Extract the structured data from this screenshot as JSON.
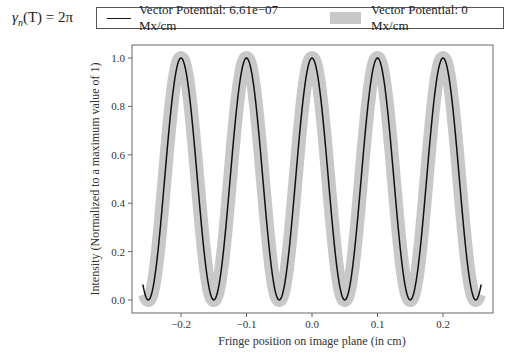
{
  "formula": {
    "symbol": "γ",
    "subscript": "n",
    "arg": "(T)",
    "rhs": "= 2π"
  },
  "legend": {
    "items": [
      {
        "label": "Vector Potential: 6.61e−07 Mx/cm",
        "style": "line",
        "color": "#111111"
      },
      {
        "label": "Vector Potential: 0 Mx/cm",
        "style": "patch",
        "color": "#c8c8c8"
      }
    ]
  },
  "chart_data": {
    "type": "line",
    "title": "",
    "xlabel": "Fringe position on image plane (in cm)",
    "ylabel": "Intensity (Normalized to a maximum value of 1)",
    "xlim": [
      -0.27,
      0.27
    ],
    "ylim": [
      -0.05,
      1.05
    ],
    "xticks": [
      -0.2,
      -0.1,
      0.0,
      0.1,
      0.2
    ],
    "xtick_labels": [
      "−0.2",
      "−0.1",
      "0.0",
      "0.1",
      "0.2"
    ],
    "yticks": [
      0.0,
      0.2,
      0.4,
      0.6,
      0.8,
      1.0
    ],
    "ytick_labels": [
      "0.0",
      "0.2",
      "0.4",
      "0.6",
      "0.8",
      "1.0"
    ],
    "grid": false,
    "legend_position": "top, outside axes",
    "series": [
      {
        "name": "Vector Potential: 0 Mx/cm",
        "color": "#c8c8c8",
        "linewidth": 14,
        "function": "cos^2(pi*x/0.1)",
        "x_range": [
          -0.255,
          0.255
        ],
        "peaks_x": [
          -0.2,
          -0.1,
          0.0,
          0.1,
          0.2
        ],
        "minima_x": [
          -0.25,
          -0.15,
          -0.05,
          0.05,
          0.15,
          0.25
        ],
        "x": [
          -0.25,
          -0.2,
          -0.15,
          -0.1,
          -0.05,
          0.0,
          0.05,
          0.1,
          0.15,
          0.2,
          0.25
        ],
        "y": [
          0.0,
          1.0,
          0.0,
          1.0,
          0.0,
          1.0,
          0.0,
          1.0,
          0.0,
          1.0,
          0.0
        ]
      },
      {
        "name": "Vector Potential: 6.61e−07 Mx/cm",
        "color": "#111111",
        "linewidth": 1.5,
        "function": "cos^2(pi*x/0.1)",
        "x_range": [
          -0.258,
          0.258
        ],
        "peaks_x": [
          -0.2,
          -0.1,
          0.0,
          0.1,
          0.2
        ],
        "minima_x": [
          -0.25,
          -0.15,
          -0.05,
          0.05,
          0.15,
          0.25
        ],
        "x": [
          -0.25,
          -0.2,
          -0.15,
          -0.1,
          -0.05,
          0.0,
          0.05,
          0.1,
          0.15,
          0.2,
          0.25
        ],
        "y": [
          0.0,
          1.0,
          0.0,
          1.0,
          0.0,
          1.0,
          0.0,
          1.0,
          0.0,
          1.0,
          0.0
        ]
      }
    ]
  }
}
